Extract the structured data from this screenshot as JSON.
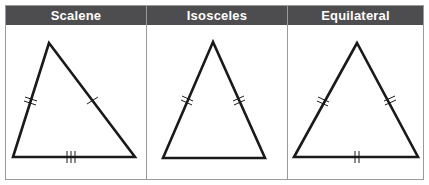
{
  "columns": [
    {
      "title": "Scalene"
    },
    {
      "title": "Isosceles"
    },
    {
      "title": "Equilateral"
    }
  ],
  "colors": {
    "header_bg": "#4d4d4f",
    "header_text": "#ffffff",
    "border": "#9a9a9a",
    "stroke": "#1a1a1a"
  },
  "triangles": [
    {
      "type": "scalene",
      "vertices": [
        [
          49,
          43
        ],
        [
          13,
          157
        ],
        [
          135,
          157
        ]
      ],
      "tick_marks": {
        "left": 2,
        "right": 1,
        "base": 3
      }
    },
    {
      "type": "isosceles",
      "vertices": [
        [
          213,
          42
        ],
        [
          163,
          158
        ],
        [
          265,
          158
        ]
      ],
      "tick_marks": {
        "left": 2,
        "right": 2,
        "base": 0
      }
    },
    {
      "type": "equilateral",
      "vertices": [
        [
          357,
          43
        ],
        [
          294,
          157
        ],
        [
          418,
          157
        ]
      ],
      "tick_marks": {
        "left": 2,
        "right": 2,
        "base": 2
      }
    }
  ]
}
